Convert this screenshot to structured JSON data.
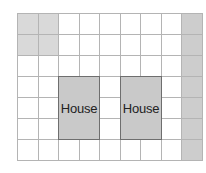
{
  "diagram": {
    "grid": {
      "columns": 9,
      "rows": 7,
      "line_color": "#b4b4b4",
      "shaded_cells_light": [
        [
          0,
          0
        ],
        [
          0,
          1
        ],
        [
          1,
          0
        ],
        [
          1,
          1
        ]
      ],
      "shaded_column_right": 8,
      "light_shade_color": "#d9d9d9",
      "right_shade_color": "#cdcdcd"
    },
    "houses": [
      {
        "label": "House",
        "col_start": 2,
        "col_span": 2,
        "row_start": 3,
        "row_span": 3
      },
      {
        "label": "House",
        "col_start": 5,
        "col_span": 2,
        "row_start": 3,
        "row_span": 3
      }
    ],
    "house_fill_color": "#c9c9c9",
    "house_border_color": "#6e6e6e"
  }
}
